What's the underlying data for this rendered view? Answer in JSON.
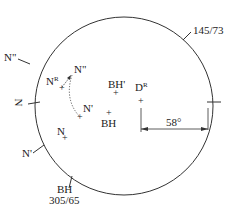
{
  "diagram": {
    "type": "stereonet",
    "stroke_color": "#333333",
    "primitive_circle": {
      "cx": 124,
      "cy": 106,
      "r": 89
    },
    "ticks": [
      {
        "label": "145/73",
        "name": "tick-145-73"
      },
      {
        "label": "N\"",
        "name": "tick-n-double-prime"
      },
      {
        "label": "N",
        "name": "tick-n",
        "rotated": true
      },
      {
        "label": "N'",
        "name": "tick-n-prime"
      },
      {
        "label": "BH",
        "sublabel": "305/65",
        "name": "tick-bh"
      },
      {
        "label": "",
        "name": "tick-right"
      }
    ],
    "points": [
      {
        "label": "N",
        "sup": "R",
        "name": "point-n-rotated"
      },
      {
        "label": "N\"",
        "sup": "",
        "name": "point-n-double-prime"
      },
      {
        "label": "N'",
        "sup": "",
        "name": "point-n-prime"
      },
      {
        "label": "N",
        "sup": "",
        "name": "point-n"
      },
      {
        "label": "BH'",
        "sup": "",
        "name": "point-bh-prime"
      },
      {
        "label": "BH",
        "sup": "",
        "name": "point-bh"
      },
      {
        "label": "D",
        "sup": "R",
        "name": "point-d-rotated"
      }
    ],
    "angle": {
      "label": "58°"
    }
  }
}
